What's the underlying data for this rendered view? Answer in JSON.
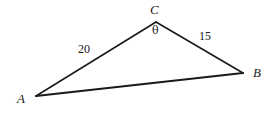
{
  "figure": {
    "type": "triangle-diagram",
    "background_color": "#ffffff",
    "stroke_color": "#1a1a1a",
    "label_color": "#1a1a1a",
    "stroke_width": 1.6,
    "vertices": [
      {
        "name": "A",
        "label": "A",
        "x": 36,
        "y": 96
      },
      {
        "name": "B",
        "label": "B",
        "x": 243,
        "y": 73
      },
      {
        "name": "C",
        "label": "C",
        "x": 156,
        "y": 22
      }
    ],
    "vertex_labels": {
      "a": "A",
      "b": "B",
      "c": "C"
    },
    "sides": [
      {
        "name": "AC",
        "label": "20",
        "from": "A",
        "to": "C"
      },
      {
        "name": "BC",
        "label": "15",
        "from": "C",
        "to": "B"
      },
      {
        "name": "AB",
        "label": "",
        "from": "A",
        "to": "B"
      }
    ],
    "side_labels": {
      "ac": "20",
      "bc": "15"
    },
    "angles": [
      {
        "at": "C",
        "label": "θ"
      }
    ],
    "angle_labels": {
      "theta": "θ"
    }
  }
}
